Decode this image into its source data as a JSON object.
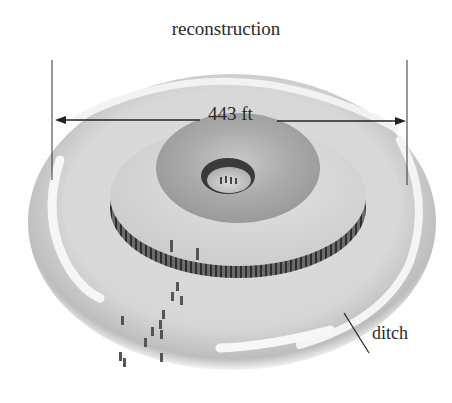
{
  "figure": {
    "title": "reconstruction",
    "dimension_label": "443 ft",
    "callouts": [
      {
        "label": "ditch"
      }
    ]
  },
  "colors": {
    "background": "#ffffff",
    "outer_bank": "#cfcfcf",
    "ditch_highlight": "#f4f4f4",
    "plateau": "#d9d9d9",
    "mound_top": "#a8a8a8",
    "post_ring": "#3a3a3a",
    "text": "#2a2a2a"
  }
}
